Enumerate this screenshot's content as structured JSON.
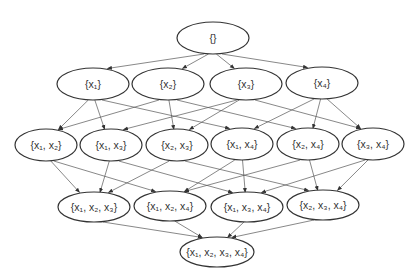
{
  "diagram": {
    "type": "hasse-diagram",
    "nodes": [
      {
        "id": "e",
        "label": "{}",
        "cx": 213,
        "cy": 38,
        "rx": 36,
        "ry": 16
      },
      {
        "id": "1",
        "label": "{x₁}",
        "cx": 93,
        "cy": 84,
        "rx": 36,
        "ry": 16
      },
      {
        "id": "2",
        "label": "{x₂}",
        "cx": 168,
        "cy": 84,
        "rx": 36,
        "ry": 16
      },
      {
        "id": "3",
        "label": "{x₃}",
        "cx": 246,
        "cy": 84,
        "rx": 36,
        "ry": 16
      },
      {
        "id": "4",
        "label": "{x₄}",
        "cx": 322,
        "cy": 83,
        "rx": 36,
        "ry": 16
      },
      {
        "id": "12",
        "label": "{x₁, x₂}",
        "cx": 46,
        "cy": 145,
        "rx": 31,
        "ry": 16
      },
      {
        "id": "13",
        "label": "{x₁, x₃}",
        "cx": 111,
        "cy": 145,
        "rx": 31,
        "ry": 16
      },
      {
        "id": "23",
        "label": "{x₂, x₃}",
        "cx": 177,
        "cy": 145,
        "rx": 31,
        "ry": 16
      },
      {
        "id": "14",
        "label": "{x₁, x₄}",
        "cx": 242,
        "cy": 144,
        "rx": 31,
        "ry": 16
      },
      {
        "id": "24",
        "label": "{x₂, x₄}",
        "cx": 308,
        "cy": 144,
        "rx": 31,
        "ry": 16
      },
      {
        "id": "34",
        "label": "{x₃, x₄}",
        "cx": 373,
        "cy": 144,
        "rx": 31,
        "ry": 16
      },
      {
        "id": "123",
        "label": "{x₁, x₂, x₃}",
        "cx": 94,
        "cy": 207,
        "rx": 36,
        "ry": 15
      },
      {
        "id": "124",
        "label": "{x₁, x₂, x₄}",
        "cx": 170,
        "cy": 206,
        "rx": 36,
        "ry": 15
      },
      {
        "id": "134",
        "label": "{x₁, x₃, x₄}",
        "cx": 247,
        "cy": 207,
        "rx": 36,
        "ry": 15
      },
      {
        "id": "234",
        "label": "{x₂, x₃, x₄}",
        "cx": 323,
        "cy": 205,
        "rx": 36,
        "ry": 15
      },
      {
        "id": "1234",
        "label": "{x₁, x₂, x₃, x₄}",
        "cx": 217,
        "cy": 252,
        "rx": 37,
        "ry": 15
      }
    ],
    "edges": [
      [
        "e",
        "1"
      ],
      [
        "e",
        "2"
      ],
      [
        "e",
        "3"
      ],
      [
        "e",
        "4"
      ],
      [
        "1",
        "12"
      ],
      [
        "1",
        "13"
      ],
      [
        "1",
        "14"
      ],
      [
        "2",
        "12"
      ],
      [
        "2",
        "23"
      ],
      [
        "2",
        "24"
      ],
      [
        "3",
        "13"
      ],
      [
        "3",
        "23"
      ],
      [
        "3",
        "34"
      ],
      [
        "4",
        "14"
      ],
      [
        "4",
        "24"
      ],
      [
        "4",
        "34"
      ],
      [
        "12",
        "123"
      ],
      [
        "12",
        "124"
      ],
      [
        "13",
        "123"
      ],
      [
        "13",
        "134"
      ],
      [
        "23",
        "123"
      ],
      [
        "23",
        "234"
      ],
      [
        "14",
        "124"
      ],
      [
        "14",
        "134"
      ],
      [
        "24",
        "124"
      ],
      [
        "24",
        "234"
      ],
      [
        "34",
        "134"
      ],
      [
        "34",
        "234"
      ],
      [
        "123",
        "1234"
      ],
      [
        "124",
        "1234"
      ],
      [
        "134",
        "1234"
      ],
      [
        "234",
        "1234"
      ]
    ],
    "colors": {
      "stroke": "#333333",
      "edge": "#555555",
      "background": "#ffffff"
    }
  }
}
